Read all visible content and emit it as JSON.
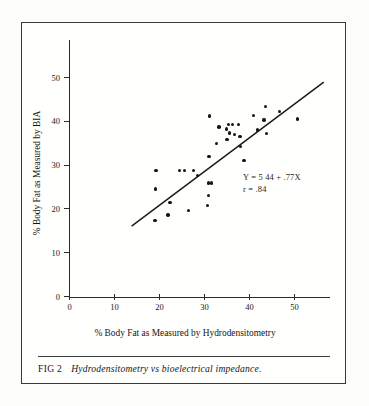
{
  "figure": {
    "caption_number": "FIG 2",
    "caption_text": "Hydrodensitometry vs bioelectrical impedance.",
    "frame_color": "#3a3a3a",
    "background_color": "#fdfdfb",
    "ink_color": "#151515"
  },
  "chart_data": {
    "type": "scatter",
    "title": "",
    "xlabel": "% Body Fat as Measured by Hydrodensitometry",
    "ylabel": "% Body Fat as Measured by BIA",
    "xlim": [
      0,
      58
    ],
    "ylim": [
      0,
      57
    ],
    "xticks": [
      0,
      10,
      20,
      30,
      40,
      50
    ],
    "yticks": [
      0,
      10,
      20,
      30,
      40,
      50
    ],
    "xticklabels": [
      "0",
      "10",
      "20",
      "30",
      "40",
      "50"
    ],
    "yticklabels": [
      "0",
      "10",
      "20",
      "30",
      "40",
      "50"
    ],
    "grid": false,
    "legend": null,
    "annotations": [
      "Y = 5.44 + .77X",
      "r = .84"
    ],
    "annotation_lines": {
      "equation": "Y = 5 44 + .77X",
      "correlation": "r =  .84"
    },
    "regression": {
      "slope": 0.77,
      "intercept": 5.44,
      "r": 0.84,
      "x_start": 13.8,
      "x_end": 56.5
    },
    "series": [
      {
        "name": "subjects",
        "marker": "filled-circle",
        "color": "#151515",
        "points": [
          [
            19.0,
            17.4
          ],
          [
            19.1,
            24.5
          ],
          [
            19.2,
            28.7
          ],
          [
            21.9,
            18.6
          ],
          [
            22.3,
            21.5
          ],
          [
            24.5,
            28.7
          ],
          [
            25.6,
            28.7
          ],
          [
            26.4,
            19.6
          ],
          [
            27.5,
            28.7
          ],
          [
            28.4,
            27.6
          ],
          [
            30.6,
            20.8
          ],
          [
            30.9,
            23.0
          ],
          [
            30.9,
            25.9
          ],
          [
            31.6,
            25.9
          ],
          [
            31.0,
            32.0
          ],
          [
            31.1,
            41.2
          ],
          [
            32.6,
            35.0
          ],
          [
            33.2,
            38.7
          ],
          [
            34.9,
            38.2
          ],
          [
            35.0,
            35.8
          ],
          [
            35.4,
            39.3
          ],
          [
            36.2,
            39.3
          ],
          [
            35.6,
            37.3
          ],
          [
            36.6,
            37.0
          ],
          [
            37.5,
            39.3
          ],
          [
            37.9,
            36.5
          ],
          [
            38.0,
            34.2
          ],
          [
            38.8,
            31.1
          ],
          [
            40.9,
            41.3
          ],
          [
            41.8,
            38.0
          ],
          [
            43.2,
            40.3
          ],
          [
            43.5,
            43.4
          ],
          [
            43.8,
            37.2
          ],
          [
            46.6,
            42.3
          ],
          [
            50.7,
            40.5
          ]
        ]
      }
    ]
  }
}
